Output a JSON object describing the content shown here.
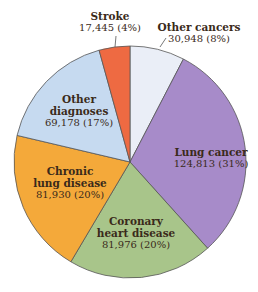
{
  "chart_data": {
    "type": "pie",
    "title": "",
    "slices": [
      {
        "label": "Other cancers",
        "value": 30948,
        "percent": 8,
        "display": "30,948 (8%)",
        "color": "#eaeef7"
      },
      {
        "label": "Lung cancer",
        "value": 124813,
        "percent": 31,
        "display": "124,813 (31%)",
        "color": "#a78bc9"
      },
      {
        "label": "Coronary heart disease",
        "value": 81976,
        "percent": 20,
        "display": "81,976 (20%)",
        "color": "#a8c58a"
      },
      {
        "label": "Chronic lung disease",
        "value": 81930,
        "percent": 20,
        "display": "81,930 (20%)",
        "color": "#f4a93a"
      },
      {
        "label": "Other diagnoses",
        "value": 69178,
        "percent": 17,
        "display": "69,178 (17%)",
        "color": "#c6daf0"
      },
      {
        "label": "Stroke",
        "value": 17445,
        "percent": 4,
        "display": "17,445 (4%)",
        "color": "#ee6a42"
      }
    ],
    "start_angle": "12 o'clock",
    "direction": "clockwise",
    "legend": "none (direct labels)"
  },
  "labels": {
    "other_cancers": {
      "name": "Other cancers",
      "value": "30,948 (8%)"
    },
    "lung_cancer": {
      "name": "Lung cancer",
      "value": "124,813 (31%)"
    },
    "coronary": {
      "name1": "Coronary",
      "name2": "heart disease",
      "value": "81,976 (20%)"
    },
    "chronic": {
      "name1": "Chronic",
      "name2": "lung disease",
      "value": "81,930 (20%)"
    },
    "other_diag": {
      "name1": "Other",
      "name2": "diagnoses",
      "value": "69,178 (17%)"
    },
    "stroke": {
      "name": "Stroke",
      "value": "17,445 (4%)"
    }
  }
}
